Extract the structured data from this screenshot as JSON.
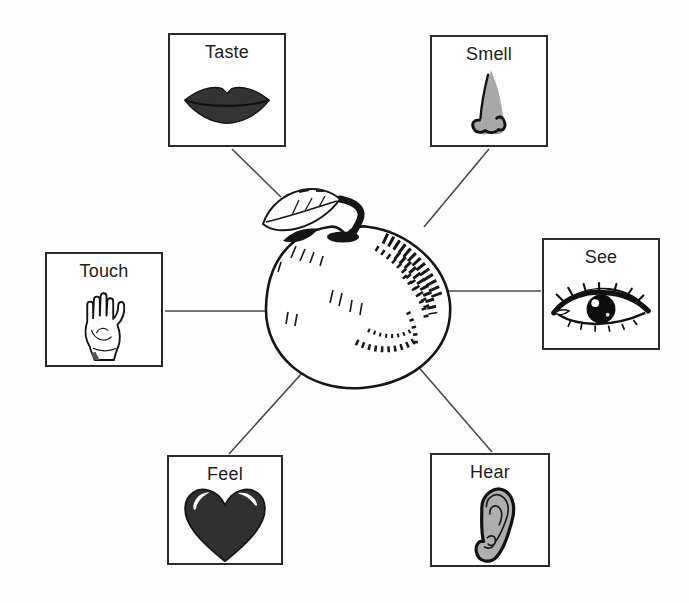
{
  "figure": {
    "type": "diagram",
    "description_of_center": "apple",
    "center": {
      "icon": "apple-illustration"
    },
    "senses": [
      {
        "id": "taste",
        "label": "Taste",
        "icon": "lips-icon"
      },
      {
        "id": "smell",
        "label": "Smell",
        "icon": "nose-icon"
      },
      {
        "id": "touch",
        "label": "Touch",
        "icon": "hand-icon"
      },
      {
        "id": "see",
        "label": "See",
        "icon": "eye-icon"
      },
      {
        "id": "feel",
        "label": "Feel",
        "icon": "heart-icon"
      },
      {
        "id": "hear",
        "label": "Hear",
        "icon": "ear-icon"
      }
    ],
    "connections": [
      {
        "from": "taste",
        "to": "apple"
      },
      {
        "from": "smell",
        "to": "apple"
      },
      {
        "from": "touch",
        "to": "apple"
      },
      {
        "from": "see",
        "to": "apple"
      },
      {
        "from": "feel",
        "to": "apple"
      },
      {
        "from": "hear",
        "to": "apple"
      }
    ],
    "colors": {
      "background": "#fefefe",
      "box_border": "#2b2b2b",
      "connector": "#4a4a4a",
      "ink": "#161616",
      "lips_fill": "#343434",
      "nose_fill": "#a8a8a8",
      "heart_fill": "#303030",
      "ear_fill": "#aeaeae"
    }
  }
}
